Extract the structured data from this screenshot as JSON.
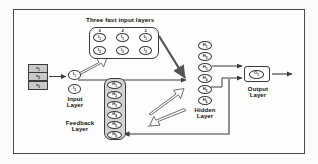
{
  "diagram": {
    "title_top": "Three fast input layers",
    "captions": {
      "input_layer": "Input\nLayer",
      "feedback_layer": "Feedback\nLayer",
      "hidden_layer": "Hidden\nLayer",
      "output_layer": "Output\nLayer"
    },
    "column_numbers": [
      "3",
      "2",
      "1"
    ],
    "external_inputs": [
      {
        "label": "x",
        "sub": "1"
      },
      {
        "label": "x",
        "sub": "2"
      },
      {
        "label": "x",
        "sub": "3"
      }
    ],
    "input_layer_nodes": [
      {
        "label": "I",
        "sub": "1"
      },
      {
        "label": "I",
        "sub": "2"
      }
    ],
    "fast_input_columns": [
      {
        "number": "3",
        "nodes": [
          {
            "label": "I",
            "sub": "1"
          },
          {
            "label": "I",
            "sub": "2"
          }
        ]
      },
      {
        "number": "2",
        "nodes": [
          {
            "label": "I",
            "sub": "1"
          },
          {
            "label": "I",
            "sub": "2"
          }
        ]
      },
      {
        "number": "1",
        "nodes": [
          {
            "label": "I",
            "sub": "1"
          },
          {
            "label": "I",
            "sub": "2"
          }
        ]
      }
    ],
    "hidden_layer_nodes": [
      {
        "label": "H",
        "sub": "1"
      },
      {
        "label": "H",
        "sub": "2"
      },
      {
        "label": "H",
        "sub": "3"
      },
      {
        "label": "H",
        "sub": "4"
      },
      {
        "label": "H",
        "sub": "5"
      },
      {
        "label": "H",
        "sub": "6"
      }
    ],
    "feedback_layer_nodes": [
      {
        "label": "H",
        "sub": "1"
      },
      {
        "label": "H",
        "sub": "2"
      },
      {
        "label": "H",
        "sub": "3"
      },
      {
        "label": "H",
        "sub": "4"
      },
      {
        "label": "H",
        "sub": "5"
      },
      {
        "label": "H",
        "sub": "6"
      }
    ],
    "output_layer_nodes": [
      {
        "label": "O",
        "sub": "1"
      }
    ],
    "colors": {
      "stroke": "#3a3a3a",
      "input_box_fill": "#c9c9c9",
      "feedback_group_fill": "#d2d2d2",
      "frame": "#4a4a4a",
      "page": "#fdfdfc"
    }
  }
}
